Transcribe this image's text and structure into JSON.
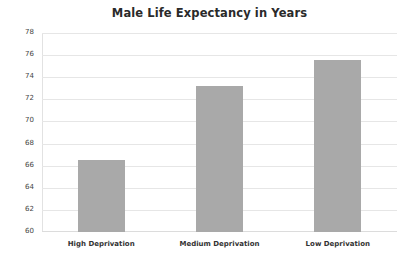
{
  "chart_data": {
    "type": "bar",
    "title": "Male Life Expectancy in Years",
    "xlabel": "",
    "ylabel": "",
    "categories": [
      "High Deprivation",
      "Medium Deprivation",
      "Low Deprivation"
    ],
    "values": [
      66.5,
      73.2,
      75.6
    ],
    "ylim": [
      60,
      78
    ],
    "yticks": [
      "60",
      "62",
      "64",
      "66",
      "68",
      "70",
      "72",
      "74",
      "76",
      "78"
    ],
    "grid": true,
    "legend": null,
    "bar_color": "#a9a9a9"
  }
}
